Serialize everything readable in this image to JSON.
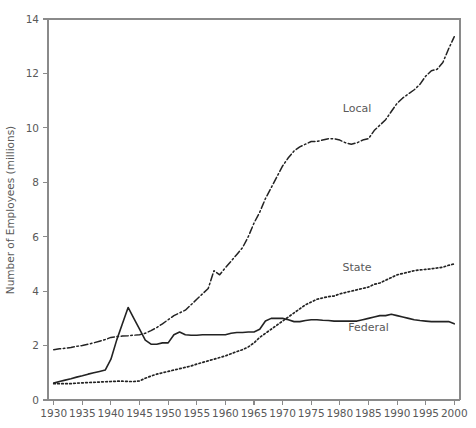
{
  "chart_data": {
    "type": "line",
    "title": "",
    "xlabel": "",
    "ylabel": "Number of Employees (millions)",
    "xlim": [
      1929,
      2001
    ],
    "ylim": [
      0,
      14
    ],
    "grid": false,
    "legend_position": "inline-labels",
    "x_ticks": [
      1930,
      1935,
      1940,
      1945,
      1950,
      1955,
      1960,
      1965,
      1970,
      1975,
      1980,
      1985,
      1990,
      1995,
      2000
    ],
    "x_tick_labels": [
      "1930",
      "1935",
      "1940",
      "1945",
      "1950",
      "1955",
      "1960",
      "1965",
      "1970",
      "1975",
      "1980",
      "1985",
      "1990",
      "1995",
      "2000"
    ],
    "y_ticks": [
      0,
      2,
      4,
      6,
      8,
      10,
      12,
      14
    ],
    "y_tick_labels": [
      "0",
      "2",
      "4",
      "6",
      "8",
      "10",
      "12",
      "14"
    ],
    "x": [
      1930,
      1931,
      1932,
      1933,
      1934,
      1935,
      1936,
      1937,
      1938,
      1939,
      1940,
      1941,
      1942,
      1943,
      1944,
      1945,
      1946,
      1947,
      1948,
      1949,
      1950,
      1951,
      1952,
      1953,
      1954,
      1955,
      1956,
      1957,
      1958,
      1959,
      1960,
      1961,
      1962,
      1963,
      1964,
      1965,
      1966,
      1967,
      1968,
      1969,
      1970,
      1971,
      1972,
      1973,
      1974,
      1975,
      1976,
      1977,
      1978,
      1979,
      1980,
      1981,
      1982,
      1983,
      1984,
      1985,
      1986,
      1987,
      1988,
      1989,
      1990,
      1991,
      1992,
      1993,
      1994,
      1995,
      1996,
      1997,
      1998,
      1999,
      2000
    ],
    "series": [
      {
        "name": "Local",
        "label": "Local",
        "line_style": "dash-dot",
        "color": "#232323",
        "label_position": {
          "x": 1983,
          "y": 10.6
        },
        "values": [
          1.85,
          1.88,
          1.9,
          1.93,
          1.97,
          2.0,
          2.05,
          2.1,
          2.16,
          2.22,
          2.3,
          2.33,
          2.35,
          2.36,
          2.38,
          2.4,
          2.45,
          2.55,
          2.66,
          2.8,
          2.95,
          3.1,
          3.2,
          3.3,
          3.5,
          3.7,
          3.9,
          4.1,
          4.75,
          4.6,
          4.86,
          5.1,
          5.35,
          5.6,
          6.0,
          6.5,
          6.9,
          7.4,
          7.8,
          8.2,
          8.6,
          8.9,
          9.15,
          9.3,
          9.4,
          9.5,
          9.5,
          9.55,
          9.6,
          9.6,
          9.55,
          9.45,
          9.4,
          9.45,
          9.55,
          9.6,
          9.9,
          10.1,
          10.3,
          10.6,
          10.9,
          11.1,
          11.25,
          11.4,
          11.6,
          11.9,
          12.1,
          12.15,
          12.4,
          12.9,
          13.35
        ]
      },
      {
        "name": "State",
        "label": "State",
        "line_style": "dotted",
        "color": "#232323",
        "label_position": {
          "x": 1983,
          "y": 4.75
        },
        "values": [
          0.6,
          0.6,
          0.6,
          0.6,
          0.62,
          0.63,
          0.64,
          0.65,
          0.66,
          0.67,
          0.68,
          0.69,
          0.69,
          0.68,
          0.68,
          0.7,
          0.8,
          0.88,
          0.95,
          1.0,
          1.05,
          1.1,
          1.15,
          1.2,
          1.25,
          1.32,
          1.38,
          1.44,
          1.5,
          1.56,
          1.62,
          1.7,
          1.78,
          1.85,
          1.95,
          2.1,
          2.3,
          2.45,
          2.6,
          2.75,
          2.9,
          3.05,
          3.2,
          3.35,
          3.5,
          3.6,
          3.7,
          3.75,
          3.8,
          3.82,
          3.9,
          3.95,
          4.0,
          4.05,
          4.1,
          4.15,
          4.25,
          4.3,
          4.4,
          4.5,
          4.6,
          4.65,
          4.7,
          4.75,
          4.78,
          4.8,
          4.82,
          4.85,
          4.88,
          4.95,
          5.0
        ]
      },
      {
        "name": "Federal",
        "label": "Federal",
        "line_style": "solid",
        "color": "#232323",
        "label_position": {
          "x": 1985,
          "y": 2.55
        },
        "values": [
          0.62,
          0.68,
          0.73,
          0.78,
          0.84,
          0.89,
          0.95,
          1.0,
          1.05,
          1.1,
          1.5,
          2.2,
          2.8,
          3.4,
          3.0,
          2.6,
          2.2,
          2.05,
          2.05,
          2.1,
          2.1,
          2.4,
          2.5,
          2.4,
          2.38,
          2.38,
          2.4,
          2.4,
          2.4,
          2.4,
          2.4,
          2.45,
          2.48,
          2.48,
          2.5,
          2.5,
          2.6,
          2.9,
          3.0,
          3.0,
          3.0,
          2.95,
          2.88,
          2.88,
          2.92,
          2.95,
          2.95,
          2.93,
          2.92,
          2.9,
          2.9,
          2.9,
          2.9,
          2.9,
          2.95,
          3.0,
          3.05,
          3.1,
          3.1,
          3.15,
          3.1,
          3.05,
          3.0,
          2.95,
          2.92,
          2.9,
          2.88,
          2.88,
          2.88,
          2.88,
          2.8
        ]
      }
    ]
  }
}
